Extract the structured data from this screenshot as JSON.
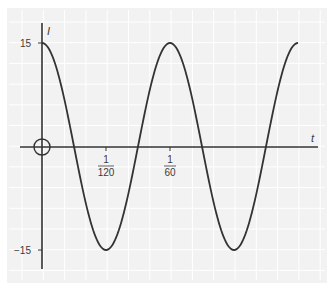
{
  "chart_data": {
    "type": "line",
    "title": "",
    "xlabel": "t",
    "ylabel": "I",
    "function": "I = 15 cos(120πt)",
    "amplitude": 15,
    "period": "1/60",
    "x_ticks": [
      {
        "value": "1/120",
        "numerator": "1",
        "denominator": "120"
      },
      {
        "value": "1/60",
        "numerator": "1",
        "denominator": "60"
      }
    ],
    "y_ticks": [
      "15",
      "-15"
    ],
    "x_range": [
      0,
      "1/30"
    ],
    "ylim": [
      -15,
      15
    ],
    "grid": true,
    "legend": "none",
    "origin_marker": "circle",
    "series": [
      {
        "name": "I",
        "x": [
          0,
          "1/240",
          "1/120",
          "1/80",
          "1/60",
          "1/48",
          "1/40",
          "7/240",
          "1/30"
        ],
        "values": [
          15,
          0,
          -15,
          0,
          15,
          0,
          -15,
          0,
          15
        ]
      }
    ]
  },
  "labels": {
    "y_axis": "I",
    "x_axis": "t",
    "y_top": "15",
    "y_bottom": "−15",
    "x_tick1_num": "1",
    "x_tick1_den": "120",
    "x_tick2_num": "1",
    "x_tick2_den": "60"
  },
  "colors": {
    "panel": "#f2f2f2",
    "grid": "#ffffff",
    "curve": "#333333",
    "axis": "#333333"
  }
}
